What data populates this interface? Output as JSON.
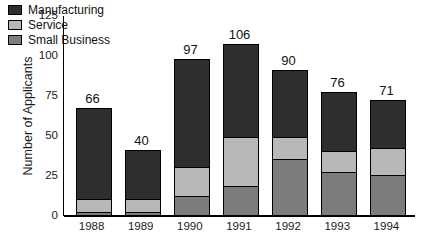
{
  "chart_data": {
    "type": "bar",
    "subtype": "stacked-bar",
    "title": "",
    "xlabel": "",
    "ylabel": "Number of Applicants",
    "categories": [
      "1988",
      "1989",
      "1990",
      "1991",
      "1992",
      "1993",
      "1994"
    ],
    "ylim": [
      0,
      125
    ],
    "yticks": [
      125,
      100,
      75,
      50,
      25,
      0
    ],
    "grid": false,
    "legend_position": "top-left-inside",
    "series": [
      {
        "name": "Manufacturing",
        "color": "#2e2e2e",
        "values": [
          56,
          30,
          67,
          57,
          41,
          36,
          29
        ]
      },
      {
        "name": "Service",
        "color": "#b8b8b8",
        "values": [
          8,
          8,
          18,
          31,
          14,
          13,
          17
        ]
      },
      {
        "name": "Small Business",
        "color": "#7c7c7c",
        "values": [
          2,
          2,
          12,
          18,
          35,
          27,
          25
        ]
      }
    ],
    "stack_order_bottom_to_top": [
      "Small Business",
      "Service",
      "Manufacturing"
    ],
    "totals": [
      66,
      40,
      97,
      106,
      90,
      76,
      71
    ],
    "total_labels": [
      "66",
      "40",
      "97",
      "106",
      "90",
      "76",
      "71"
    ]
  },
  "axis": {
    "y_title": "Number of Applicants",
    "y_ticks": [
      "125",
      "100",
      "75",
      "50",
      "25",
      "0"
    ],
    "x_ticks": [
      "1988",
      "1989",
      "1990",
      "1991",
      "1992",
      "1993",
      "1994"
    ]
  },
  "legend": {
    "items": [
      {
        "label": "Manufacturing",
        "color": "#2e2e2e"
      },
      {
        "label": "Service",
        "color": "#b8b8b8"
      },
      {
        "label": "Small Business",
        "color": "#7c7c7c"
      }
    ]
  }
}
